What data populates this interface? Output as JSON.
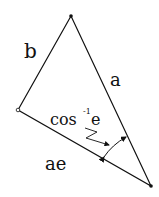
{
  "diagram": {
    "vertices": {
      "top": [
        71,
        16
      ],
      "left": [
        18,
        110
      ],
      "right": [
        151,
        186
      ]
    },
    "labels": {
      "side_left": "b",
      "side_right": "a",
      "side_bottom": "ae",
      "angle": "cos",
      "angle_sup": "-1",
      "angle_var": "e"
    },
    "colors": {
      "stroke": "#111111",
      "background": "#ffffff"
    }
  }
}
